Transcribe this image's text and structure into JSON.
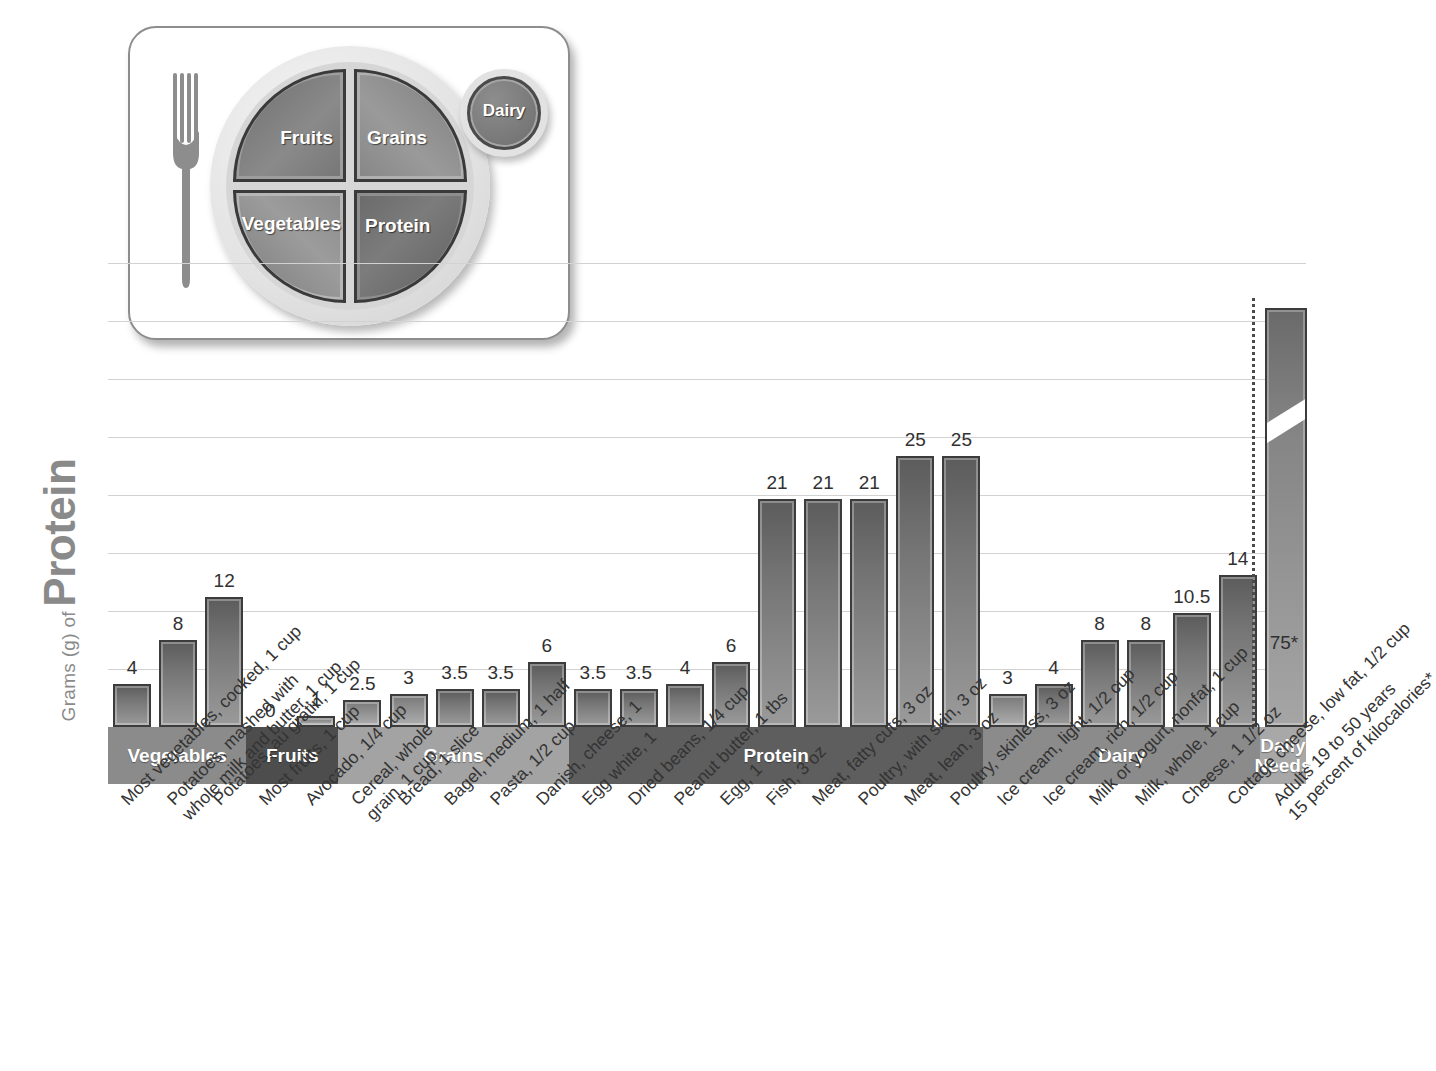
{
  "myplate": {
    "title": "MyPlate",
    "segments": [
      {
        "name": "Fruits",
        "label": "Fruits"
      },
      {
        "name": "Grains",
        "label": "Grains"
      },
      {
        "name": "Vegetables",
        "label": "Vegetables"
      },
      {
        "name": "Protein",
        "label": "Protein"
      },
      {
        "name": "Dairy",
        "label": "Dairy"
      }
    ]
  },
  "axis": {
    "title_small": "Grams (g) of",
    "title_big": "Protein"
  },
  "chart_data": {
    "type": "bar",
    "title": "Grams (g) of Protein",
    "xlabel": "",
    "ylabel": "Grams (g) of Protein",
    "ylim": [
      0,
      40
    ],
    "grid": true,
    "legend": "none",
    "note": "Daily Needs bar is drawn with an axis break; its true value is 75 g.",
    "categories": [
      "Most vegetables, cooked, 1 cup",
      "Potatoes, mashed with whole milk and butter, 1 cup",
      "Potatoes, au gratin, 1 cup",
      "Most fruits, 1 cup",
      "Avocado, 1/4 cup",
      "Cereal, whole grain, 1 cup",
      "Bread, 1 slice",
      "Bagel, medium, 1 half",
      "Pasta, 1/2 cup",
      "Danish, cheese, 1",
      "Egg white, 1",
      "Dried beans, 1/4 cup",
      "Peanut butter, 1 tbs",
      "Egg, 1",
      "Fish, 3 oz",
      "Meat, fatty cuts, 3 oz",
      "Poultry, with skin, 3 oz",
      "Meat, lean, 3 oz",
      "Poultry, skinless, 3 oz",
      "Ice cream, light, 1/2 cup",
      "Ice cream, rich, 1/2 cup",
      "Milk or yogurt, nonfat, 1 cup",
      "Milk, whole, 1 cup",
      "Cheese, 1 1/2 oz",
      "Cottage cheese, low fat, 1/2 cup",
      "Adults 19 to 50 years 15 percent of kilocalories*"
    ],
    "values": [
      4,
      8,
      12,
      0,
      1,
      2.5,
      3,
      3.5,
      3.5,
      6,
      3.5,
      3.5,
      4,
      6,
      21,
      21,
      21,
      25,
      25,
      3,
      4,
      8,
      8,
      10.5,
      14,
      75
    ],
    "value_labels": [
      "4",
      "8",
      "12",
      "0",
      "1",
      "2.5",
      "3",
      "3.5",
      "3.5",
      "6",
      "3.5",
      "3.5",
      "4",
      "6",
      "21",
      "21",
      "21",
      "25",
      "25",
      "3",
      "4",
      "8",
      "8",
      "10.5",
      "14",
      "75*"
    ],
    "groups": [
      {
        "label": "Vegetables",
        "start": 0,
        "count": 3,
        "color": "#8b8b8b"
      },
      {
        "label": "Fruits",
        "start": 3,
        "count": 2,
        "color": "#4d4d4d"
      },
      {
        "label": "Grains",
        "start": 5,
        "count": 5,
        "color": "#a3a3a3"
      },
      {
        "label": "Protein",
        "start": 10,
        "count": 9,
        "color": "#5e5e5e"
      },
      {
        "label": "Dairy",
        "start": 19,
        "count": 6,
        "color": "#8b8b8b"
      },
      {
        "label": "Daily\nNeeds",
        "start": 25,
        "count": 1,
        "color": "#a8a8a8"
      }
    ],
    "x_label_lines": [
      [
        "Most vegetables, cooked, 1 cup"
      ],
      [
        "Potatoes, mashed with",
        "whole milk and butter, 1 cup"
      ],
      [
        "Potatoes, au gratin, 1 cup"
      ],
      [
        "Most fruits, 1 cup"
      ],
      [
        "Avocado, 1/4 cup"
      ],
      [
        "Cereal, whole",
        "grain, 1 cup"
      ],
      [
        "Bread, 1 slice"
      ],
      [
        "Bagel, medium, 1 half"
      ],
      [
        "Pasta, 1/2 cup"
      ],
      [
        "Danish, cheese, 1"
      ],
      [
        "Egg white, 1"
      ],
      [
        "Dried beans, 1/4 cup"
      ],
      [
        "Peanut butter, 1 tbs"
      ],
      [
        "Egg, 1"
      ],
      [
        "Fish, 3 oz"
      ],
      [
        "Meat, fatty cuts, 3 oz"
      ],
      [
        "Poultry, with skin, 3 oz"
      ],
      [
        "Meat, lean, 3 oz"
      ],
      [
        "Poultry, skinless, 3 oz"
      ],
      [
        "Ice cream, light, 1/2 cup"
      ],
      [
        "Ice cream, rich, 1/2 cup"
      ],
      [
        "Milk or yogurt, nonfat, 1 cup"
      ],
      [
        "Milk, whole, 1 cup"
      ],
      [
        "Cheese, 1 1/2 oz"
      ],
      [
        "Cottage cheese, low fat, 1/2 cup"
      ],
      [
        "Adults 19 to 50 years",
        "15 percent of kilocalories*"
      ]
    ]
  },
  "colors": {
    "bar_dark": "#5c5c5c",
    "bar_light": "#9a9a9a",
    "bar_outline": "#3c3c3c",
    "gridline": "#d2d2d2",
    "axis_title": "#8a8a8a",
    "text": "#343434"
  }
}
